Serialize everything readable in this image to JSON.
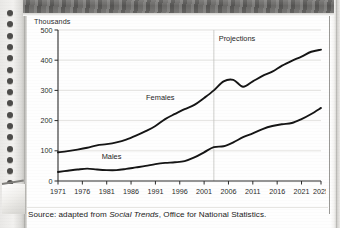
{
  "page": {
    "running_title": "",
    "source_prefix": "Source: adapted from ",
    "source_italic": "Social Trends",
    "source_suffix": ", Office for National Statistics."
  },
  "chart_data": {
    "type": "line",
    "title": "",
    "ylabel": "Thousands",
    "xlabel": "",
    "ylim": [
      0,
      500
    ],
    "yticks": [
      0,
      100,
      200,
      300,
      400,
      500
    ],
    "xlim": [
      1971,
      2025
    ],
    "xticks": [
      1971,
      1976,
      1981,
      1986,
      1991,
      1996,
      2001,
      2006,
      2011,
      2016,
      2021,
      2025
    ],
    "grid": "horizontal",
    "legend": "inline-labels",
    "annotations": [
      {
        "text": "Projections",
        "x": 2004,
        "y": 465
      },
      {
        "text": "Females",
        "x": 1992,
        "y": 268
      },
      {
        "text": "Males",
        "x": 1982,
        "y": 72
      }
    ],
    "projection_divider_x": 2003,
    "x": [
      1971,
      1973,
      1975,
      1977,
      1979,
      1981,
      1983,
      1985,
      1987,
      1989,
      1991,
      1993,
      1995,
      1997,
      1999,
      2001,
      2003,
      2005,
      2007,
      2009,
      2011,
      2013,
      2015,
      2017,
      2019,
      2021,
      2023,
      2025
    ],
    "series": [
      {
        "name": "Females",
        "values": [
          95,
          99,
          104,
          110,
          118,
          122,
          128,
          137,
          150,
          165,
          182,
          205,
          222,
          238,
          252,
          275,
          300,
          330,
          335,
          312,
          330,
          348,
          362,
          382,
          398,
          412,
          428,
          435
        ]
      },
      {
        "name": "Males",
        "values": [
          30,
          34,
          38,
          41,
          38,
          36,
          36,
          40,
          45,
          50,
          56,
          60,
          62,
          66,
          78,
          95,
          112,
          115,
          128,
          145,
          158,
          172,
          182,
          188,
          192,
          205,
          222,
          242
        ]
      }
    ]
  }
}
